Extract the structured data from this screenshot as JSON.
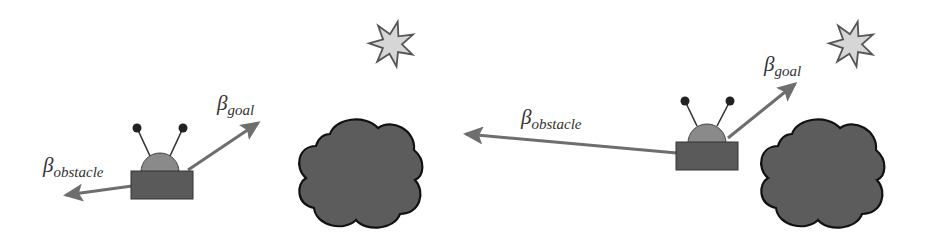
{
  "colors": {
    "background": "#ffffff",
    "arrow": "#6e6e6e",
    "robot_body": "#5a5a5a",
    "robot_dome": "#8a8a8a",
    "antenna": "#333333",
    "obstacle_fill": "#5c5c5c",
    "obstacle_stroke": "#111111",
    "goal_fill": "#d6d6d6",
    "goal_stroke": "#555555",
    "label": "#333333"
  },
  "scenes": [
    {
      "name": "scene-left",
      "labels": {
        "goal": {
          "symbol": "β",
          "subscript": "goal"
        },
        "obstacle": {
          "symbol": "β",
          "subscript": "obstacle"
        }
      }
    },
    {
      "name": "scene-right",
      "labels": {
        "goal": {
          "symbol": "β",
          "subscript": "goal"
        },
        "obstacle": {
          "symbol": "β",
          "subscript": "obstacle"
        }
      }
    }
  ],
  "icons": [
    "robot-icon",
    "obstacle-cloud-icon",
    "goal-star-icon",
    "arrow-icon"
  ]
}
